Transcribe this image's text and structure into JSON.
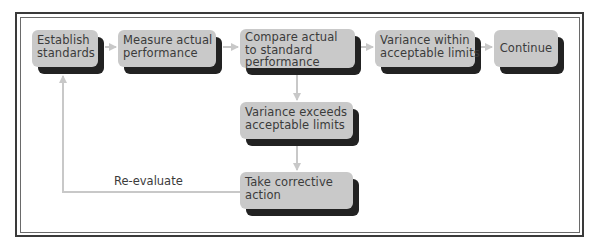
{
  "diagram": {
    "type": "flowchart",
    "title": "",
    "colors": {
      "box_fill": "#c9c9c9",
      "box_shadow": "#222222",
      "connector": "#c8c8c8",
      "text": "#3b3b3b",
      "frame": "#3a3a3a"
    },
    "nodes": [
      {
        "id": "establish",
        "lines": [
          "Establish",
          "standards"
        ]
      },
      {
        "id": "measure",
        "lines": [
          "Measure actual",
          "performance"
        ]
      },
      {
        "id": "compare",
        "lines": [
          "Compare actual",
          "to standard",
          "performance"
        ]
      },
      {
        "id": "within",
        "lines": [
          "Variance within",
          "acceptable limits"
        ]
      },
      {
        "id": "continue",
        "lines": [
          "Continue"
        ]
      },
      {
        "id": "exceeds",
        "lines": [
          "Variance exceeds",
          "acceptable limits"
        ]
      },
      {
        "id": "corrective",
        "lines": [
          "Take corrective",
          "action"
        ]
      }
    ],
    "edges": [
      {
        "from": "establish",
        "to": "measure",
        "label": ""
      },
      {
        "from": "measure",
        "to": "compare",
        "label": ""
      },
      {
        "from": "compare",
        "to": "within",
        "label": ""
      },
      {
        "from": "within",
        "to": "continue",
        "label": ""
      },
      {
        "from": "compare",
        "to": "exceeds",
        "label": ""
      },
      {
        "from": "exceeds",
        "to": "corrective",
        "label": ""
      },
      {
        "from": "corrective",
        "to": "establish",
        "label": "Re-evaluate"
      }
    ],
    "feedback_label": "Re-evaluate"
  }
}
